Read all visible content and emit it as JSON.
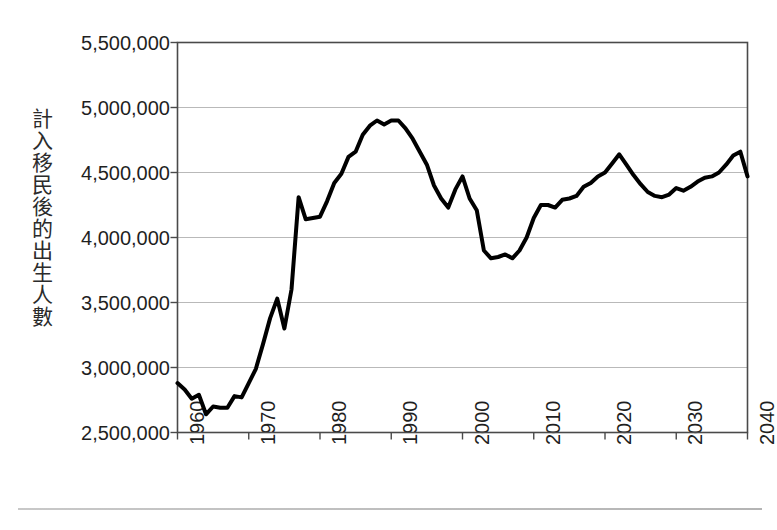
{
  "chart_data": {
    "type": "line",
    "title": "",
    "subtitle": "",
    "xlabel": "",
    "ylabel": "計入移民後的出生人數",
    "xlim": [
      1960,
      2040
    ],
    "ylim": [
      2500000,
      5500000
    ],
    "grid": true,
    "legend": false,
    "legend_position": "none",
    "y_ticks": [
      5500000,
      5000000,
      4500000,
      4000000,
      3500000,
      3000000,
      2500000
    ],
    "y_tick_labels": [
      "5,500,000",
      "5,000,000",
      "4,500,000",
      "4,000,000",
      "3,500,000",
      "3,000,000",
      "2,500,000"
    ],
    "x_ticks": [
      1960,
      1970,
      1980,
      1990,
      2000,
      2010,
      2020,
      2030,
      2040
    ],
    "x_tick_labels": [
      "1960",
      "1970",
      "1980",
      "1990",
      "2000",
      "2010",
      "2020",
      "2030",
      "2040"
    ],
    "series": [
      {
        "name": "計入移民後的出生人數",
        "color": "#000000",
        "line_width": 4,
        "x": [
          1960,
          1961,
          1962,
          1963,
          1964,
          1965,
          1966,
          1967,
          1968,
          1969,
          1970,
          1971,
          1972,
          1973,
          1974,
          1975,
          1976,
          1977,
          1978,
          1979,
          1980,
          1981,
          1982,
          1983,
          1984,
          1985,
          1986,
          1987,
          1988,
          1989,
          1990,
          1991,
          1992,
          1993,
          1994,
          1995,
          1996,
          1997,
          1998,
          1999,
          2000,
          2001,
          2002,
          2003,
          2004,
          2005,
          2006,
          2007,
          2008,
          2009,
          2010,
          2011,
          2012,
          2013,
          2014,
          2015,
          2016,
          2017,
          2018,
          2019,
          2020,
          2021,
          2022,
          2023,
          2024,
          2025,
          2026,
          2027,
          2028,
          2029,
          2030,
          2031,
          2032,
          2033,
          2034,
          2035,
          2036,
          2037,
          2038,
          2039,
          2040
        ],
        "y": [
          2880000,
          2830000,
          2760000,
          2790000,
          2640000,
          2700000,
          2690000,
          2690000,
          2780000,
          2770000,
          2880000,
          2990000,
          3180000,
          3380000,
          3530000,
          3300000,
          3600000,
          4310000,
          4140000,
          4150000,
          4160000,
          4280000,
          4420000,
          4490000,
          4620000,
          4660000,
          4790000,
          4860000,
          4900000,
          4870000,
          4900000,
          4900000,
          4840000,
          4760000,
          4660000,
          4560000,
          4400000,
          4300000,
          4230000,
          4370000,
          4470000,
          4300000,
          4210000,
          3900000,
          3840000,
          3850000,
          3870000,
          3840000,
          3900000,
          4000000,
          4150000,
          4250000,
          4250000,
          4230000,
          4290000,
          4300000,
          4320000,
          4390000,
          4420000,
          4470000,
          4500000,
          4570000,
          4640000,
          4560000,
          4480000,
          4410000,
          4350000,
          4320000,
          4310000,
          4330000,
          4380000,
          4360000,
          4390000,
          4430000,
          4460000,
          4470000,
          4500000,
          4560000,
          4630000,
          4660000,
          4470000
        ]
      }
    ],
    "notable_points": {
      "start_1960": 2880000,
      "trough_1964": 2640000,
      "spike_1977": 4310000,
      "peak_1988_1991": 4900000,
      "trough_2004": 3840000,
      "local_peak_2000": 4470000,
      "local_peak_2022": 4640000,
      "peak_2039": 4660000,
      "end_2040": 4470000
    }
  },
  "axes": {
    "y_title": "計入移民後的出生人數"
  }
}
